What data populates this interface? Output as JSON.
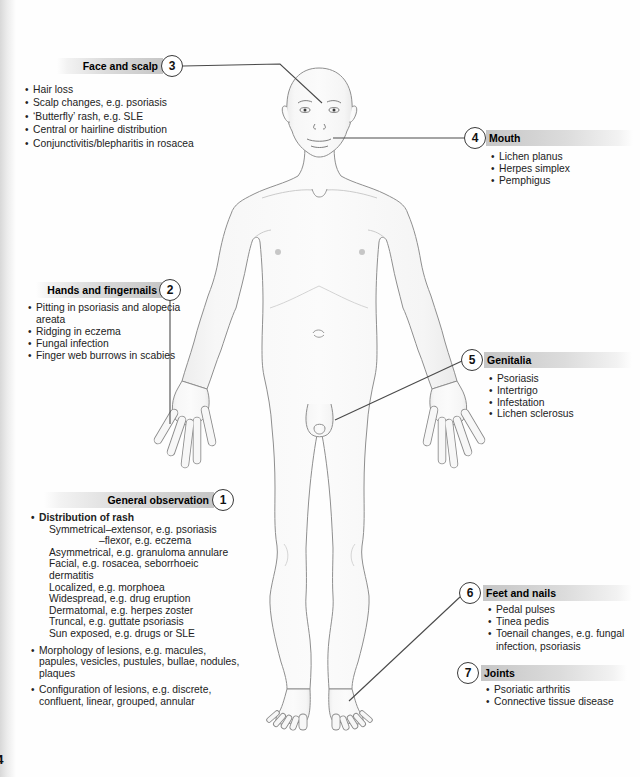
{
  "page": {
    "number": "4"
  },
  "colors": {
    "header_bar": "#c9c9c9",
    "connector_line": "#4a4a4a",
    "body_outline": "#8f8f8f",
    "body_fill": "#f7f7f7",
    "badge_border": "#3a3a3a",
    "text": "#1c1c1c"
  },
  "callouts": [
    {
      "id": "face-and-scalp",
      "number": "3",
      "title": "Face and scalp",
      "side": "left",
      "items": [
        {
          "text": "Hair loss"
        },
        {
          "text": "Scalp changes, e.g. psoriasis"
        },
        {
          "text": "‘Butterfly’ rash, e.g. SLE"
        },
        {
          "text": "Central or hairline distribution"
        },
        {
          "text": "Conjunctivitis/blepharitis in rosacea"
        }
      ]
    },
    {
      "id": "mouth",
      "number": "4",
      "title": "Mouth",
      "side": "right",
      "items": [
        {
          "text": "Lichen planus"
        },
        {
          "text": "Herpes simplex"
        },
        {
          "text": "Pemphigus"
        }
      ]
    },
    {
      "id": "hands-and-fingernails",
      "number": "2",
      "title": "Hands and fingernails",
      "side": "left",
      "items": [
        {
          "text": "Pitting in psoriasis and alopecia areata"
        },
        {
          "text": "Ridging in eczema"
        },
        {
          "text": "Fungal infection"
        },
        {
          "text": "Finger web burrows in scabies"
        }
      ]
    },
    {
      "id": "genitalia",
      "number": "5",
      "title": "Genitalia",
      "side": "right",
      "items": [
        {
          "text": "Psoriasis"
        },
        {
          "text": "Intertrigo"
        },
        {
          "text": "Infestation"
        },
        {
          "text": "Lichen sclerosus"
        }
      ]
    },
    {
      "id": "general-observation",
      "number": "1",
      "title": "General observation",
      "side": "left",
      "items": [
        {
          "text": "Distribution of rash",
          "bullet": true,
          "bold": true
        },
        {
          "text": "Symmetrical–extensor, e.g. psoriasis",
          "bullet": false,
          "indent": 1
        },
        {
          "text": "–flexor, e.g. eczema",
          "bullet": false,
          "indent": 2
        },
        {
          "text": "Asymmetrical, e.g. granuloma annulare",
          "bullet": false,
          "indent": 1
        },
        {
          "text": "Facial, e.g. rosacea, seborrhoeic dermatitis",
          "bullet": false,
          "indent": 1
        },
        {
          "text": "Localized, e.g. morphoea",
          "bullet": false,
          "indent": 1
        },
        {
          "text": "Widespread, e.g. drug eruption",
          "bullet": false,
          "indent": 1
        },
        {
          "text": "Dermatomal, e.g. herpes zoster",
          "bullet": false,
          "indent": 1
        },
        {
          "text": "Truncal, e.g. guttate psoriasis",
          "bullet": false,
          "indent": 1
        },
        {
          "text": "Sun exposed, e.g. drugs or SLE",
          "bullet": false,
          "indent": 1
        },
        {
          "text": "Morphology of lesions, e.g. macules, papules, vesicles, pustules, bullae, nodules, plaques",
          "bullet": true,
          "gap": true
        },
        {
          "text": "Configuration of lesions, e.g. discrete, confluent, linear, grouped, annular",
          "bullet": true,
          "gap": true
        }
      ]
    },
    {
      "id": "feet-and-nails",
      "number": "6",
      "title": "Feet and nails",
      "side": "right",
      "items": [
        {
          "text": "Pedal pulses"
        },
        {
          "text": "Tinea pedis"
        },
        {
          "text": "Toenail changes, e.g. fungal infection, psoriasis"
        }
      ]
    },
    {
      "id": "joints",
      "number": "7",
      "title": "Joints",
      "side": "right",
      "items": [
        {
          "text": "Psoriatic arthritis"
        },
        {
          "text": "Connective tissue disease"
        }
      ]
    }
  ]
}
